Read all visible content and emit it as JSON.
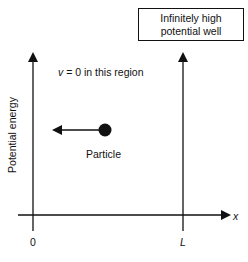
{
  "diagram": {
    "title_box": {
      "line1": "Infinitely high",
      "line2": "potential well"
    },
    "region_note": {
      "variable": "v",
      "text": " = 0 in this region"
    },
    "particle_label": "Particle",
    "y_axis_label": "Potential energy",
    "x_axis_label": "x",
    "tick_labels": {
      "origin": "0",
      "right_wall": "L"
    },
    "colors": {
      "ink": "#111111",
      "background": "#ffffff"
    }
  }
}
